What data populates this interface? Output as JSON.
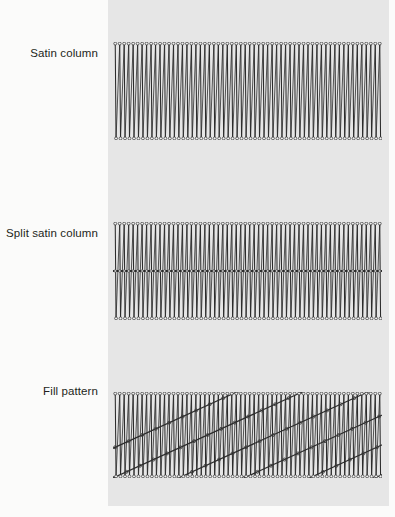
{
  "figure": {
    "canvas": {
      "width": 395,
      "height": 517
    },
    "background_color": "#fbfbfa",
    "swatch_panel": {
      "color": "#e6e6e6",
      "x": 108,
      "y": 0,
      "width": 281,
      "height": 506
    },
    "thread_color": "#2b2b2b",
    "needle_point_color": "#3a3a3a"
  },
  "labels": {
    "satin_column": "Satin column",
    "split_satin_column": "Split satin column",
    "fill_pattern": "Fill pattern"
  },
  "bands": [
    {
      "id": "satin-column",
      "label": "Satin column",
      "x": 113,
      "y": 42,
      "width": 269,
      "height": 98,
      "stitch_count": 60,
      "stitch_spacing": 4.5,
      "has_split_line": false,
      "has_fill_diagonals": false
    },
    {
      "id": "split-satin-column",
      "label": "Split satin column",
      "x": 113,
      "y": 222,
      "width": 269,
      "height": 98,
      "stitch_count": 60,
      "stitch_spacing": 4.5,
      "has_split_line": true,
      "split_line_position": 0.5,
      "has_fill_diagonals": false
    },
    {
      "id": "fill-pattern",
      "label": "Fill pattern",
      "x": 113,
      "y": 392,
      "width": 269,
      "height": 86,
      "stitch_count": 60,
      "stitch_spacing": 4.5,
      "has_split_line": false,
      "has_fill_diagonals": true,
      "diagonal_count": 7,
      "diagonal_direction": "lower-left-to-upper-right"
    }
  ]
}
